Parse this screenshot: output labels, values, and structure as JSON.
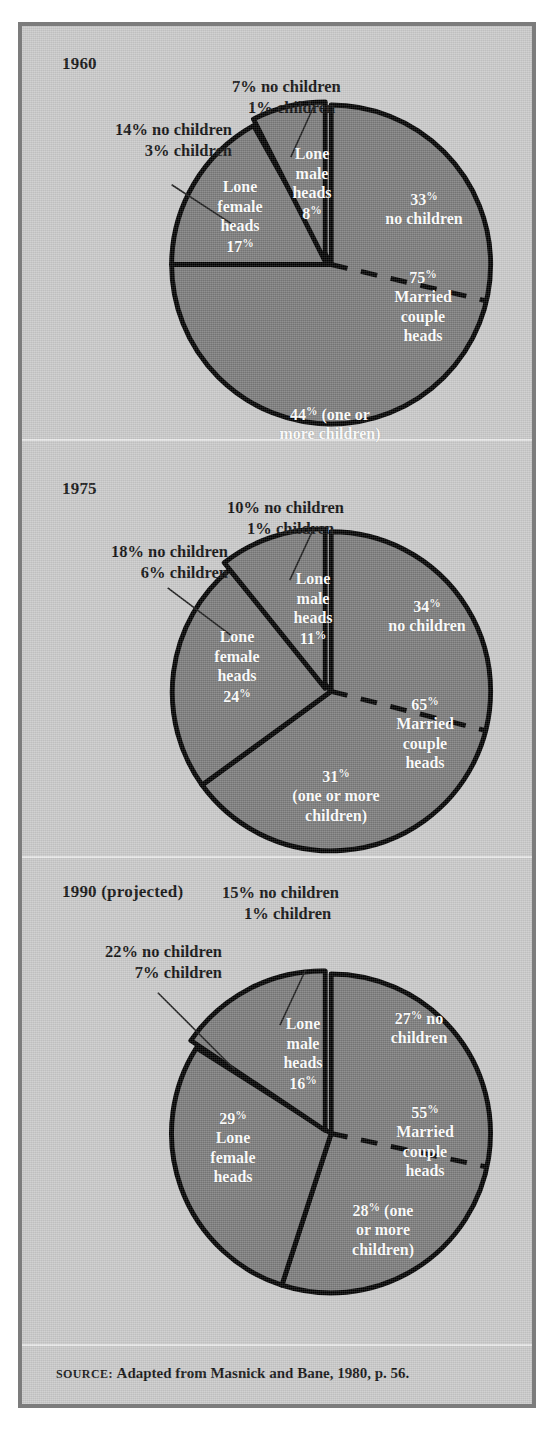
{
  "figure": {
    "colors": {
      "background": "#c9c9c9",
      "frame_border": "#7c7c7c",
      "pie_fill": "#7a7a7a",
      "pie_outline": "#000000",
      "slice_label_text": "#ffffff",
      "callout_text": "#101010"
    },
    "source_prefix": "Source:",
    "source_text": "Adapted from Masnick and Bane, 1980, p. 56."
  },
  "chart_data": [
    {
      "type": "pie",
      "title": "1960",
      "categories": [
        "Married couple heads",
        "Lone male heads",
        "Lone female heads"
      ],
      "values": [
        75,
        8,
        17
      ],
      "labels": {
        "married_total": "75%",
        "married_name_line1": "Married",
        "married_name_line2": "couple",
        "married_name_line3": "heads",
        "married_no_children": "33%",
        "married_no_children_line2": "no children",
        "married_children": "44% (one or",
        "married_children_line2": "more children)",
        "male_line1": "Lone",
        "male_line2": "male",
        "male_line3": "heads",
        "male_pct": "8%",
        "female_line1": "Lone",
        "female_line2": "female",
        "female_line3": "heads",
        "female_pct": "17%"
      },
      "callouts": {
        "male_top_line1": "7% no children",
        "male_top_line2": "1% children",
        "female_left_line1": "14% no children",
        "female_left_line2": "3% children"
      },
      "breakdown": {
        "married_couple_no_children": 33,
        "married_couple_with_children": 44,
        "lone_male_no_children": 7,
        "lone_male_children": 1,
        "lone_female_no_children": 14,
        "lone_female_children": 3
      }
    },
    {
      "type": "pie",
      "title": "1975",
      "categories": [
        "Married couple heads",
        "Lone male heads",
        "Lone female heads"
      ],
      "values": [
        65,
        11,
        24
      ],
      "labels": {
        "married_total": "65%",
        "married_name_line1": "Married",
        "married_name_line2": "couple",
        "married_name_line3": "heads",
        "married_no_children": "34%",
        "married_no_children_line2": "no children",
        "married_children": "31%",
        "married_children_line2": "(one or more",
        "married_children_line3": "children)",
        "male_line1": "Lone",
        "male_line2": "male",
        "male_line3": "heads",
        "male_pct": "11%",
        "female_line1": "Lone",
        "female_line2": "female",
        "female_line3": "heads",
        "female_pct": "24%"
      },
      "callouts": {
        "male_top_line1": "10% no children",
        "male_top_line2": "1% children",
        "female_left_line1": "18% no children",
        "female_left_line2": "6% children"
      },
      "breakdown": {
        "married_couple_no_children": 34,
        "married_couple_with_children": 31,
        "lone_male_no_children": 10,
        "lone_male_children": 1,
        "lone_female_no_children": 18,
        "lone_female_children": 6
      }
    },
    {
      "type": "pie",
      "title": "1990 (projected)",
      "categories": [
        "Married couple heads",
        "Lone male heads",
        "Lone female heads"
      ],
      "values": [
        55,
        16,
        29
      ],
      "labels": {
        "married_total": "55%",
        "married_name_line1": "Married",
        "married_name_line2": "couple",
        "married_name_line3": "heads",
        "married_no_children": "27% no",
        "married_no_children_line2": "children",
        "married_children": "28% (one",
        "married_children_line2": "or more",
        "married_children_line3": "children)",
        "male_line1": "Lone",
        "male_line2": "male",
        "male_line3": "heads",
        "male_pct": "16%",
        "female_pct": "29%",
        "female_line1": "Lone",
        "female_line2": "female",
        "female_line3": "heads"
      },
      "callouts": {
        "male_top_line1": "15% no children",
        "male_top_line2": "1% children",
        "female_left_line1": "22% no children",
        "female_left_line2": "7% children"
      },
      "breakdown": {
        "married_couple_no_children": 27,
        "married_couple_with_children": 28,
        "lone_male_no_children": 15,
        "lone_male_children": 1,
        "lone_female_no_children": 22,
        "lone_female_children": 7
      }
    }
  ]
}
